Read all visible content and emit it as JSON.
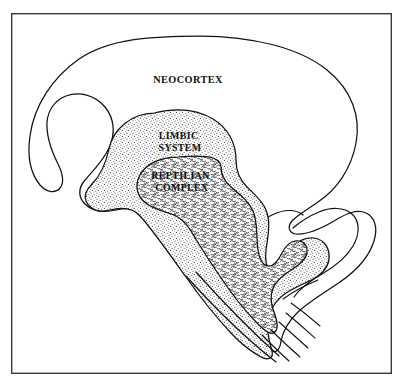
{
  "figure": {
    "background_color": "#ffffff",
    "frame": {
      "name": "outer-border",
      "color": "#3a3a3a",
      "x": 11,
      "y": 13,
      "width": 381,
      "height": 361,
      "stroke_width": 1.4
    },
    "ink_color": "#111111",
    "regions": [
      {
        "id": "neocortex",
        "label": "NEOCORTEX",
        "fill": "#ffffff",
        "texture": "none",
        "label_x": 188,
        "label_y": 83
      },
      {
        "id": "limbic-system",
        "label_line_1": "LIMBIC",
        "label_line_2": "SYSTEM",
        "fill": "#ffffff",
        "texture": "stipple",
        "texture_color": "#4a4a4a",
        "label_x": 180,
        "label_y": 139
      },
      {
        "id": "reptilian-complex",
        "label_line_1": "REPTILIAN",
        "label_line_2": "COMPLEX",
        "fill": "#ffffff",
        "texture": "squiggle",
        "texture_color": "#2b2b2b",
        "label_x": 182,
        "label_y": 179
      }
    ],
    "anatomy_parts": [
      {
        "id": "cerebellum",
        "label": ""
      },
      {
        "id": "brainstem",
        "label": ""
      },
      {
        "id": "spinal-cord",
        "label": ""
      }
    ]
  }
}
